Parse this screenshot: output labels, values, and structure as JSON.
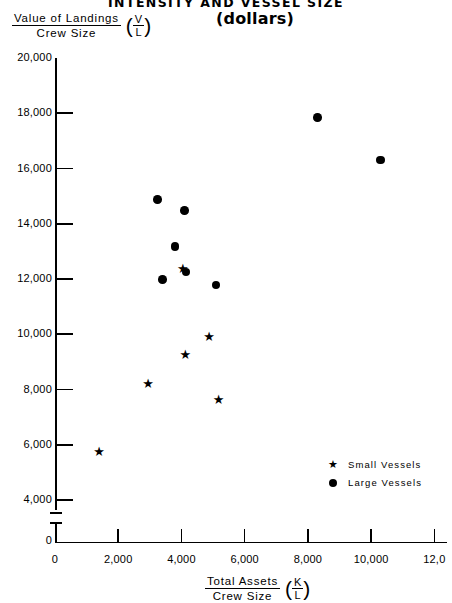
{
  "title": "INTENSITY AND VESSEL SIZE",
  "subtitle": "(dollars)",
  "y_axis": {
    "numerator": "Value of Landings",
    "denominator": "Crew Size",
    "symbol_numerator": "V",
    "symbol_denominator": "L",
    "ticks": [
      "20,000",
      "18,000",
      "16,000",
      "14,000",
      "12,000",
      "10,000",
      "8,000",
      "6,000",
      "4,000",
      "0"
    ]
  },
  "x_axis": {
    "numerator": "Total Assets",
    "denominator": "Crew Size",
    "symbol_numerator": "K",
    "symbol_denominator": "L",
    "ticks": [
      "0",
      "2,000",
      "4,000",
      "6,000",
      "8,000",
      "10,000",
      "12,0"
    ]
  },
  "legend": {
    "items": [
      {
        "marker": "star",
        "glyph": "★",
        "label": "Small Vessels"
      },
      {
        "marker": "circle",
        "glyph": "●",
        "label": "Large Vessels"
      }
    ]
  },
  "chart_data": {
    "type": "scatter",
    "title": "INTENSITY AND VESSEL SIZE",
    "subtitle": "(dollars)",
    "xlabel": "Total Assets / Crew Size (K/L)",
    "ylabel": "Value of Landings / Crew Size (V/L)",
    "xlim": [
      0,
      12000
    ],
    "ylim": [
      0,
      20000
    ],
    "y_axis_break": true,
    "y_break_between": [
      0,
      4000
    ],
    "grid": false,
    "legend_position": "lower-right",
    "xticks": [
      0,
      2000,
      4000,
      6000,
      8000,
      10000,
      12000
    ],
    "yticks": [
      0,
      4000,
      6000,
      8000,
      10000,
      12000,
      14000,
      16000,
      18000,
      20000
    ],
    "series": [
      {
        "name": "Large Vessels",
        "marker": "circle",
        "color": "#000000",
        "points": [
          {
            "x": 8300,
            "y": 17850
          },
          {
            "x": 10300,
            "y": 16300
          },
          {
            "x": 3250,
            "y": 14880
          },
          {
            "x": 4100,
            "y": 14480
          },
          {
            "x": 3800,
            "y": 13180
          },
          {
            "x": 4150,
            "y": 12250
          },
          {
            "x": 3400,
            "y": 11980
          },
          {
            "x": 5100,
            "y": 11780
          }
        ]
      },
      {
        "name": "Small Vessels",
        "marker": "star",
        "color": "#000000",
        "points": [
          {
            "x": 4050,
            "y": 12320
          },
          {
            "x": 4880,
            "y": 9850
          },
          {
            "x": 4130,
            "y": 9230
          },
          {
            "x": 2950,
            "y": 8180
          },
          {
            "x": 5180,
            "y": 7580
          },
          {
            "x": 1400,
            "y": 5700
          }
        ]
      }
    ]
  }
}
